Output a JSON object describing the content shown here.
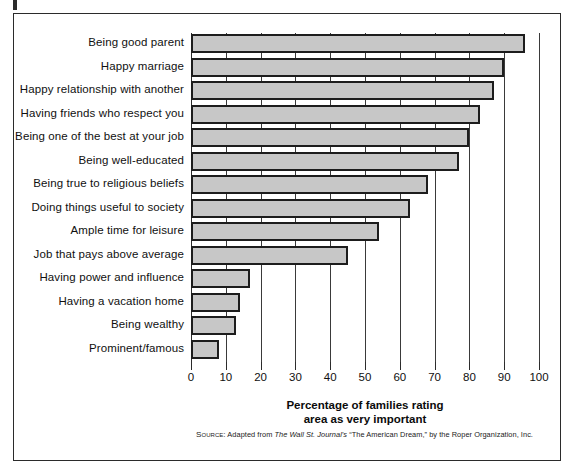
{
  "chart_data": {
    "type": "bar",
    "orientation": "horizontal",
    "title": "",
    "xlabel": "Percentage of families rating area as very important",
    "ylabel": "",
    "xlim": [
      0,
      100
    ],
    "xticks": [
      0,
      10,
      20,
      30,
      40,
      50,
      60,
      70,
      80,
      90,
      100
    ],
    "grid": "vertical",
    "legend": "none",
    "bar_color": "#c7c7c7",
    "bar_edge_color": "#1d1d1d",
    "categories": [
      "Being good parent",
      "Happy marriage",
      "Happy relationship with another",
      "Having friends who respect you",
      "Being one of the best at your job",
      "Being well-educated",
      "Being true to religious beliefs",
      "Doing things useful to society",
      "Ample time for leisure",
      "Job that pays above average",
      "Having power and influence",
      "Having a vacation home",
      "Being wealthy",
      "Prominent/famous"
    ],
    "values": [
      96,
      90,
      87,
      83,
      80,
      77,
      68,
      63,
      54,
      45,
      17,
      14,
      13,
      8
    ]
  },
  "axis_title": {
    "line1": "Percentage of families rating",
    "line2": "area as very important"
  },
  "source": {
    "prefix": "Source:",
    "text_before": " Adapted from ",
    "publication": "The Wall St. Journal's",
    "text_after": " “The American Dream,” by the Roper Organization, Inc."
  }
}
